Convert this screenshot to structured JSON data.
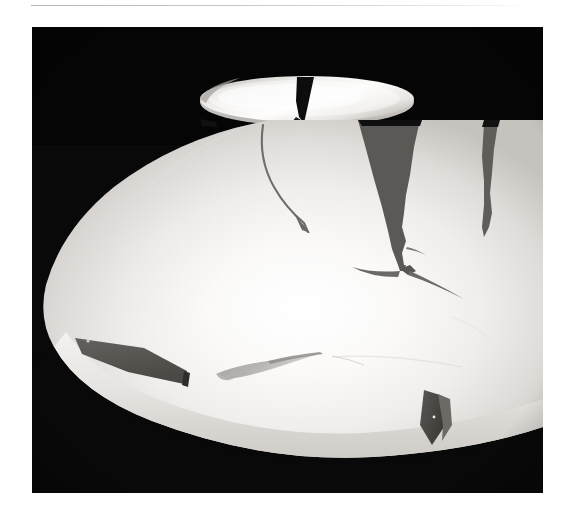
{
  "page": {
    "background_color": "#ffffff",
    "width": 566,
    "height": 526
  },
  "rule": {
    "name": "horizontal-rule",
    "color": "#c6c6c6"
  },
  "photo": {
    "alt_text": "Large white ceramic bowl with dark jagged cracks and missing chips, photographed on a black background, with a smaller cracked white dish resting behind it",
    "background_color": "#090909",
    "subject": "broken white ceramic vessel",
    "lighting": "single soft studio highlight from upper centre",
    "objects": [
      {
        "name": "small-dish",
        "label": "small shallow dish (rear)",
        "color": "#f2f0ee",
        "features": "narrow elliptical rim, one wedge-shaped crack near centre-right"
      },
      {
        "name": "large-bowl",
        "label": "large shallow bowl (front)",
        "color": "#f7f5f3",
        "features": "bright highlight at centre, three major cracks, two missing rim chips"
      }
    ],
    "cracks": [
      {
        "name": "crack-dish-wedge",
        "shade": "#141414",
        "description": "wedge crack through rear dish"
      },
      {
        "name": "crack-thin-curved",
        "shade": "#6e6e6e",
        "description": "thin curved hairline crack, upper-left of bowl"
      },
      {
        "name": "crack-main-wide",
        "shade": "#5a5a5a",
        "description": "wide tapering crack, centre of bowl, branching at the foot"
      },
      {
        "name": "crack-right",
        "shade": "#5f5f5f",
        "description": "narrow crack, right of bowl"
      },
      {
        "name": "chip-left-rim",
        "shade": "#575757",
        "description": "missing rectangular chip, lower-left rim"
      },
      {
        "name": "chip-right-rim",
        "shade": "#4a4a4a",
        "description": "missing angular chip, lower-right rim"
      },
      {
        "name": "chip-lower-centre",
        "shade": "#a9a7a5",
        "description": "shallow flake/shadow, lower-centre interior"
      }
    ]
  }
}
